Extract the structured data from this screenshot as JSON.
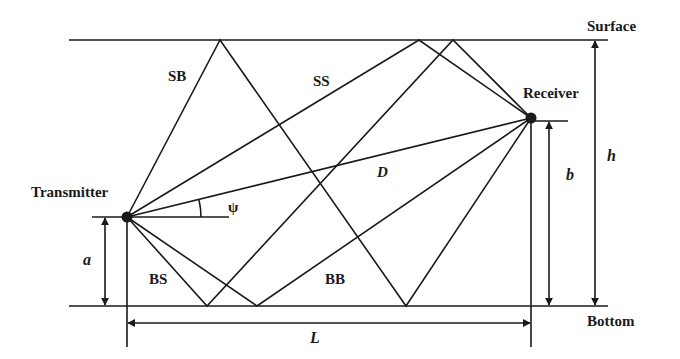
{
  "diagram": {
    "boundaries": {
      "surface_label": "Surface",
      "bottom_label": "Bottom"
    },
    "nodes": {
      "transmitter_label": "Transmitter",
      "receiver_label": "Receiver"
    },
    "paths": {
      "sb_label": "SB",
      "ss_label": "SS",
      "bs_label": "BS",
      "bb_label": "BB",
      "direct_label": "D"
    },
    "dimensions": {
      "angle_label": "ψ",
      "tx_height_label": "a",
      "rx_height_label": "b",
      "depth_label": "h",
      "range_label": "L"
    },
    "colors": {
      "line": "#1a1a1a",
      "background": "#ffffff"
    }
  }
}
